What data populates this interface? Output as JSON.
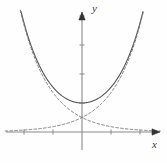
{
  "figure": {
    "name": "hyperbolic-cosine-graph",
    "background_color": "#fefefe",
    "width": 167,
    "height": 163
  },
  "axes": {
    "x_label": "x",
    "y_label": "y",
    "axis_color": "#8a8a8a",
    "arrow_color": "#333333",
    "origin_px": [
      82,
      132
    ],
    "unit_px": 29,
    "x_ticks": [
      -3,
      -2,
      -1,
      1,
      2
    ],
    "y_ticks": [
      1,
      2,
      3,
      4
    ],
    "x_axis_from_px": 6,
    "x_axis_to_px": 160,
    "y_axis_from_px": 150,
    "y_axis_to_px": 12,
    "tick_length_px": 5
  },
  "curves": {
    "solid": {
      "name": "cosh",
      "style": "solid",
      "color": "#555555",
      "width": 1.1
    },
    "dashed_rising": {
      "name": "half-exp-x",
      "style": "dashed",
      "color": "#777777",
      "width": 1.0
    },
    "dashed_decaying": {
      "name": "half-exp-neg-x",
      "style": "dashed",
      "color": "#777777",
      "width": 1.0
    }
  },
  "chart_data": {
    "type": "line",
    "title": "",
    "xlabel": "x",
    "ylabel": "y",
    "xlim": [
      -2.65,
      2.7
    ],
    "ylim": [
      -0.65,
      4.15
    ],
    "grid": false,
    "legend": null,
    "annotations": [],
    "series": [
      {
        "name": "y = cosh x",
        "style": "solid",
        "x": [
          -2.2,
          -2.0,
          -1.8,
          -1.6,
          -1.4,
          -1.2,
          -1.0,
          -0.8,
          -0.6,
          -0.4,
          -0.2,
          0.0,
          0.2,
          0.4,
          0.6,
          0.8,
          1.0,
          1.2,
          1.4,
          1.6,
          1.8,
          2.0,
          2.2
        ],
        "values": [
          4.57,
          3.76,
          3.11,
          2.58,
          2.15,
          1.81,
          1.54,
          1.34,
          1.19,
          1.08,
          1.02,
          1.0,
          1.02,
          1.08,
          1.19,
          1.34,
          1.54,
          1.81,
          2.15,
          2.58,
          3.11,
          3.76,
          4.57
        ]
      },
      {
        "name": "y = (1/2)e^x",
        "style": "dashed",
        "x": [
          -2.6,
          -2.2,
          -1.8,
          -1.4,
          -1.0,
          -0.6,
          -0.2,
          0.0,
          0.2,
          0.6,
          1.0,
          1.4,
          1.8,
          2.0,
          2.2
        ],
        "values": [
          0.037,
          0.055,
          0.083,
          0.123,
          0.184,
          0.274,
          0.409,
          0.5,
          0.611,
          0.911,
          1.359,
          2.028,
          3.025,
          3.695,
          4.512
        ]
      },
      {
        "name": "y = (1/2)e^-x",
        "style": "dashed",
        "x": [
          -2.2,
          -2.0,
          -1.8,
          -1.4,
          -1.0,
          -0.6,
          -0.2,
          0.0,
          0.2,
          0.6,
          1.0,
          1.4,
          1.8,
          2.2,
          2.6
        ],
        "values": [
          4.512,
          3.695,
          3.025,
          2.028,
          1.359,
          0.911,
          0.611,
          0.5,
          0.409,
          0.274,
          0.184,
          0.123,
          0.083,
          0.055,
          0.037
        ]
      }
    ]
  }
}
